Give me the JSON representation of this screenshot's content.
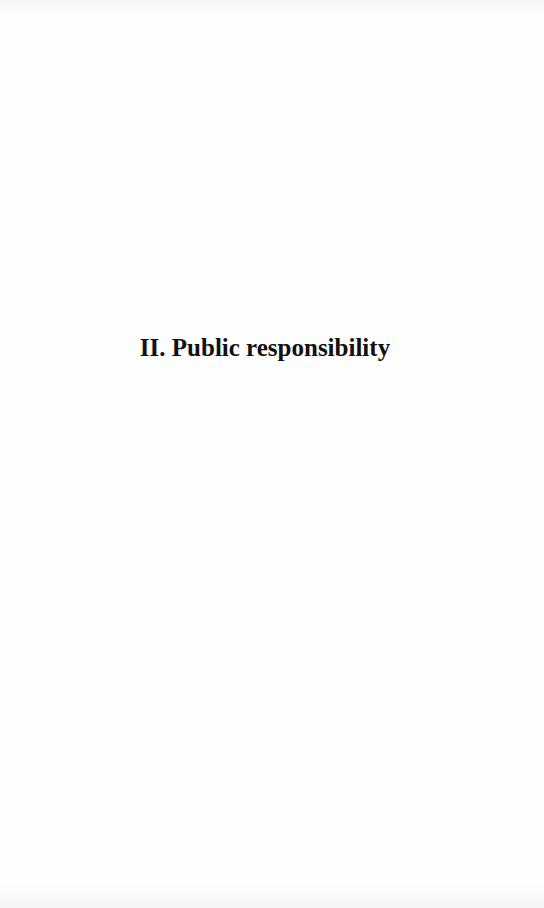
{
  "document": {
    "section_title": "II. Public responsibility"
  }
}
